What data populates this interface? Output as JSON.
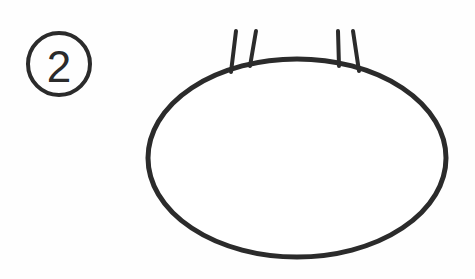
{
  "page": {
    "background_color": "#fefefe",
    "width": 475,
    "height": 279
  },
  "step_marker": {
    "label": "2",
    "shape": "circle",
    "center_x": 59,
    "center_y": 64,
    "radius": 31,
    "stroke_color": "#2b2b2b",
    "stroke_width": 4
  },
  "illustration": {
    "name": "body-outline-with-whiskers",
    "stroke_color": "#2b2b2b",
    "fill_color": "#ffffff",
    "body": {
      "type": "ellipse",
      "center_x": 297,
      "center_y": 158,
      "radius_x": 149,
      "radius_y": 99,
      "stroke_width": 5
    },
    "whiskers": [
      {
        "name": "whisker-1",
        "x1": 236,
        "y1": 31,
        "x2": 231,
        "y2": 72,
        "stroke_width": 4
      },
      {
        "name": "whisker-2",
        "x1": 256,
        "y1": 31,
        "x2": 250,
        "y2": 66,
        "stroke_width": 4
      },
      {
        "name": "whisker-3",
        "x1": 338,
        "y1": 31,
        "x2": 339,
        "y2": 66,
        "stroke_width": 4
      },
      {
        "name": "whisker-4",
        "x1": 353,
        "y1": 31,
        "x2": 359,
        "y2": 71,
        "stroke_width": 4
      }
    ]
  },
  "colors": {
    "ink": "#2b2b2b",
    "paper": "#fefefe",
    "fill": "#ffffff"
  }
}
